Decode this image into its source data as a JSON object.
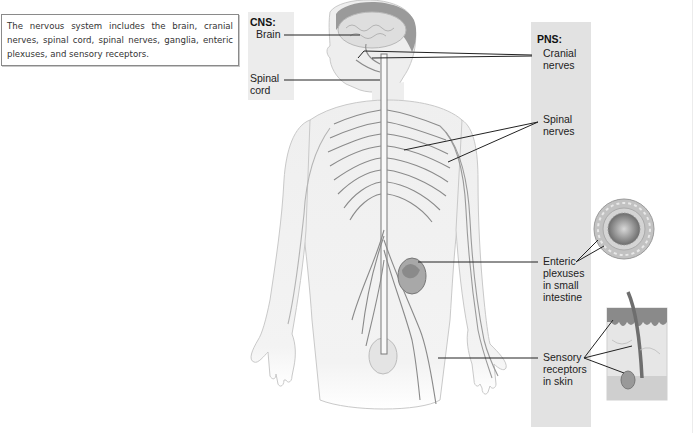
{
  "caption": {
    "text": "The nervous system includes the brain, cranial nerves, spinal cord, spinal nerves, ganglia, enteric plexuses, and sensory receptors."
  },
  "cns": {
    "heading": "CNS:",
    "labels": [
      {
        "id": "brain",
        "lines": [
          "Brain"
        ]
      },
      {
        "id": "spinal-cord",
        "lines": [
          "Spinal",
          "cord"
        ]
      }
    ]
  },
  "pns": {
    "heading": "PNS:",
    "labels": [
      {
        "id": "cranial-nerves",
        "lines": [
          "Cranial",
          "nerves"
        ]
      },
      {
        "id": "spinal-nerves",
        "lines": [
          "Spinal",
          "nerves"
        ]
      },
      {
        "id": "enteric-plexuses",
        "lines": [
          "Enteric",
          "plexuses",
          "in small",
          "intestine"
        ]
      },
      {
        "id": "sensory-receptors",
        "lines": [
          "Sensory",
          "receptors",
          "in skin"
        ]
      }
    ]
  },
  "colors": {
    "panel_bg": "#e2e2e2",
    "leader_line": "#222222",
    "body_fill": "#f2f2f2",
    "nerve": "#8a8a8a"
  }
}
